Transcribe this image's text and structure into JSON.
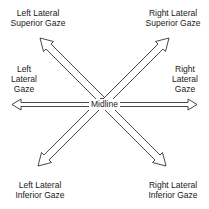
{
  "diagram": {
    "center_label": "Midline",
    "labels": {
      "left_lateral_superior": [
        "Left Lateral",
        "Superior Gaze"
      ],
      "right_lateral_superior": [
        "Right Lateral",
        "Superior Gaze"
      ],
      "left_lateral": [
        "Left",
        "Lateral",
        "Gaze"
      ],
      "right_lateral": [
        "Right",
        "Lateral",
        "Gaze"
      ],
      "left_lateral_inferior": [
        "Left Lateral",
        "Inferior Gaze"
      ],
      "right_lateral_inferior": [
        "Right Lateral",
        "Inferior Gaze"
      ]
    },
    "arrows": [
      {
        "direction": "left"
      },
      {
        "direction": "right"
      },
      {
        "direction": "up-left"
      },
      {
        "direction": "up-right"
      },
      {
        "direction": "down-left"
      },
      {
        "direction": "down-right"
      }
    ],
    "colors": {
      "stroke": "#1a1a1a",
      "background": "#ffffff"
    }
  }
}
